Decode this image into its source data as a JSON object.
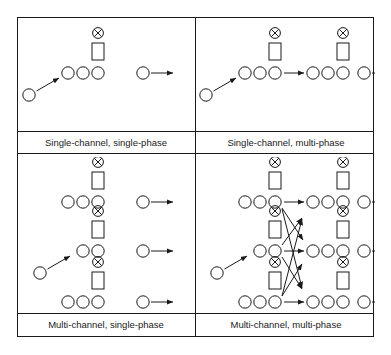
{
  "figure": {
    "width": 391,
    "height": 355,
    "background_color": "#ffffff",
    "stroke_color": "#1a1a1a",
    "label_color": "#1a1a1a",
    "grid": {
      "rows": 2,
      "cols": 2
    }
  },
  "symbols": {
    "customer": "circle",
    "server": "circle-with-x",
    "service_facility": "rectangle",
    "flow": "arrow"
  },
  "panels": [
    {
      "id": "single-channel-single-phase",
      "label": "Single-channel, single-phase",
      "row": 0,
      "col": 0,
      "channels": 1,
      "phases": 1,
      "queue_circles_per_row": [
        3
      ],
      "servers_per_row": [
        1
      ],
      "departures_per_row": [
        1
      ],
      "arrival_arrow": true,
      "crossing_routes": false
    },
    {
      "id": "single-channel-multi-phase",
      "label": "Single-channel, multi-phase",
      "row": 0,
      "col": 1,
      "channels": 1,
      "phases": 2,
      "queue_circles_per_row": [
        3,
        3
      ],
      "servers_per_row": [
        2
      ],
      "departures_per_row": [
        1
      ],
      "arrival_arrow": true,
      "crossing_routes": false
    },
    {
      "id": "multi-channel-single-phase",
      "label": "Multi-channel, single-phase",
      "row": 1,
      "col": 0,
      "channels": 3,
      "phases": 1,
      "queue_circles_per_row": [
        3,
        2,
        3
      ],
      "servers_per_row": [
        1,
        1,
        1
      ],
      "departures_per_row": [
        1,
        1,
        1
      ],
      "arrival_arrow": true,
      "crossing_routes": false
    },
    {
      "id": "multi-channel-multi-phase",
      "label": "Multi-channel, multi-phase",
      "row": 1,
      "col": 1,
      "channels": 3,
      "phases": 2,
      "queue_circles_per_row": [
        3,
        2,
        3
      ],
      "servers_per_row": [
        2,
        2,
        2
      ],
      "departures_per_row": [
        1,
        1,
        1
      ],
      "arrival_arrow": true,
      "crossing_routes": true
    }
  ]
}
